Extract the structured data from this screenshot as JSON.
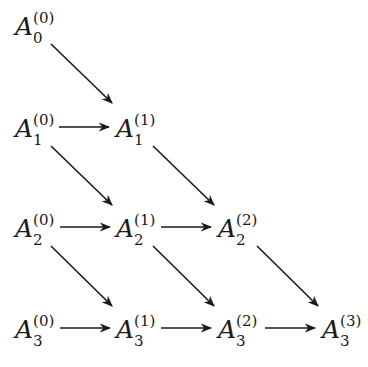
{
  "diagram": {
    "type": "triangular-recurrence-scheme",
    "colors": {
      "stroke": "#1a1a1a",
      "text": "#1a1a1a",
      "background": "#ffffff"
    },
    "nodes": [
      {
        "id": "A_0_0",
        "base": "A",
        "sub": "0",
        "sup": "(0)"
      },
      {
        "id": "A_1_0",
        "base": "A",
        "sub": "1",
        "sup": "(0)"
      },
      {
        "id": "A_1_1",
        "base": "A",
        "sub": "1",
        "sup": "(1)"
      },
      {
        "id": "A_2_0",
        "base": "A",
        "sub": "2",
        "sup": "(0)"
      },
      {
        "id": "A_2_1",
        "base": "A",
        "sub": "2",
        "sup": "(1)"
      },
      {
        "id": "A_2_2",
        "base": "A",
        "sub": "2",
        "sup": "(2)"
      },
      {
        "id": "A_3_0",
        "base": "A",
        "sub": "3",
        "sup": "(0)"
      },
      {
        "id": "A_3_1",
        "base": "A",
        "sub": "3",
        "sup": "(1)"
      },
      {
        "id": "A_3_2",
        "base": "A",
        "sub": "3",
        "sup": "(2)"
      },
      {
        "id": "A_3_3",
        "base": "A",
        "sub": "3",
        "sup": "(3)"
      }
    ],
    "edges": [
      {
        "from": "A_0_0",
        "to": "A_1_1",
        "direction": "diagonal"
      },
      {
        "from": "A_1_0",
        "to": "A_1_1",
        "direction": "horizontal"
      },
      {
        "from": "A_1_0",
        "to": "A_2_1",
        "direction": "diagonal"
      },
      {
        "from": "A_1_1",
        "to": "A_2_2",
        "direction": "diagonal"
      },
      {
        "from": "A_2_0",
        "to": "A_2_1",
        "direction": "horizontal"
      },
      {
        "from": "A_2_1",
        "to": "A_2_2",
        "direction": "horizontal"
      },
      {
        "from": "A_2_0",
        "to": "A_3_1",
        "direction": "diagonal"
      },
      {
        "from": "A_2_1",
        "to": "A_3_2",
        "direction": "diagonal"
      },
      {
        "from": "A_2_2",
        "to": "A_3_3",
        "direction": "diagonal"
      },
      {
        "from": "A_3_0",
        "to": "A_3_1",
        "direction": "horizontal"
      },
      {
        "from": "A_3_1",
        "to": "A_3_2",
        "direction": "horizontal"
      },
      {
        "from": "A_3_2",
        "to": "A_3_3",
        "direction": "horizontal"
      }
    ]
  }
}
